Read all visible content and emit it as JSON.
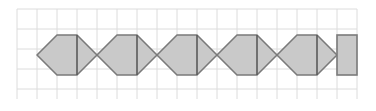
{
  "figure": {
    "canvas": {
      "width": 376,
      "height": 111,
      "background": "#ffffff"
    },
    "grid": {
      "label": "square grid",
      "origin_x": 17,
      "origin_y": 9,
      "cell_size": 20,
      "cols": 17,
      "rows": 4.5,
      "right": 357,
      "bottom": 99,
      "line_color": "#dcdcdc",
      "line_width": 1,
      "visible": true
    },
    "shapes": {
      "fill_color": "#c9c9c9",
      "stroke_color": "#7a7a7a",
      "stroke_width": 1.6,
      "divider_color": "#5a5a5a",
      "divider_width": 1.6,
      "hexagon_width": 60,
      "hexagon_height": 40,
      "tip_run": 20,
      "center_y": 55,
      "top_y": 35,
      "bottom_y": 75,
      "count_hexagons": 5,
      "count_end_squares": 1,
      "hexagons": [
        {
          "name": "hexagon-1",
          "left_tip_x": 37,
          "right_tip_x": 97,
          "divider_x": 77
        },
        {
          "name": "hexagon-2",
          "left_tip_x": 97,
          "right_tip_x": 157,
          "divider_x": 137
        },
        {
          "name": "hexagon-3",
          "left_tip_x": 157,
          "right_tip_x": 217,
          "divider_x": 197
        },
        {
          "name": "hexagon-4",
          "left_tip_x": 217,
          "right_tip_x": 277,
          "divider_x": 257
        },
        {
          "name": "hexagon-5",
          "left_tip_x": 277,
          "right_tip_x": 337,
          "divider_x": 317
        }
      ],
      "end_squares": [
        {
          "name": "end-square-right",
          "x": 337,
          "y": 35,
          "width": 20,
          "height": 40
        }
      ]
    }
  }
}
